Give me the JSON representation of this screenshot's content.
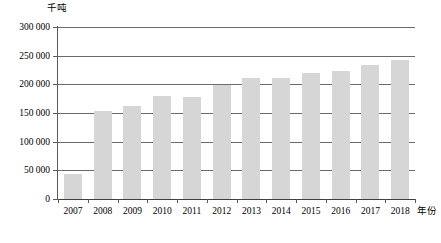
{
  "chart_data": {
    "type": "bar",
    "title": "",
    "subtitle": "",
    "xlabel": "年份",
    "ylabel": "千吨",
    "categories": [
      "2007",
      "2008",
      "2009",
      "2010",
      "2011",
      "2012",
      "2013",
      "2014",
      "2015",
      "2016",
      "2017",
      "2018"
    ],
    "values": [
      43000,
      153000,
      162000,
      180000,
      178000,
      198000,
      211000,
      211000,
      220000,
      224000,
      234000,
      243000
    ],
    "ylim": [
      0,
      300000
    ],
    "ytick_values": [
      0,
      50000,
      100000,
      150000,
      200000,
      250000,
      300000
    ],
    "ytick_labels": [
      "0",
      "50 000",
      "100 000",
      "150 000",
      "200 000",
      "250 000",
      "300 000"
    ],
    "grid": true,
    "legend": false,
    "legend_position": "none",
    "bar_color": "#d6d6d6",
    "gridline_color": "#6b6b6b",
    "axis_color": "#5a5a5a",
    "text_color": "#000000",
    "background_color": "#ffffff"
  }
}
